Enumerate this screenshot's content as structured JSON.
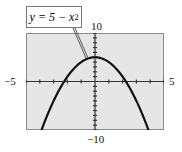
{
  "chart_data": {
    "type": "line",
    "title": "",
    "equation_label": "y = 5 − x²",
    "series": [
      {
        "name": "y = 5 - x^2",
        "x": [
          -4,
          -3.5,
          -3,
          -2.5,
          -2,
          -1.5,
          -1,
          -0.5,
          0,
          0.5,
          1,
          1.5,
          2,
          2.5,
          3,
          3.5,
          4
        ],
        "values": [
          -11,
          -7.25,
          -4,
          -1.25,
          1,
          2.75,
          4,
          4.75,
          5,
          4.75,
          4,
          2.75,
          1,
          -1.25,
          -4,
          -7.25,
          -11
        ]
      }
    ],
    "xlim": [
      -5,
      5
    ],
    "ylim": [
      -10,
      10
    ],
    "xscale": 1,
    "yscale": 1,
    "x_tick_labels": {
      "min": "−5",
      "max": "5"
    },
    "y_tick_labels": {
      "min": "−10",
      "max": "10"
    },
    "grid": false,
    "legend": "none",
    "background": "#e6e6e6",
    "curve_color": "#111111"
  },
  "labels": {
    "eq_main": "y = 5 − x",
    "eq_sup": "2",
    "xmin": "−5",
    "xmax": "5",
    "ymin": "−10",
    "ymax": "10"
  }
}
